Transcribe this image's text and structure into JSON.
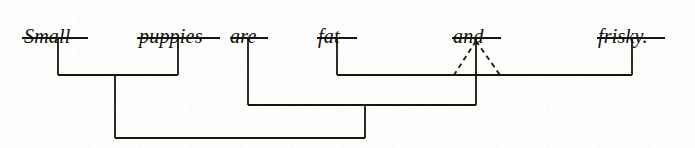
{
  "diagram": {
    "kind": "immediate-constituent-analysis",
    "sentence": "Small puppies are fat and frisky.",
    "canvas": {
      "width": 695,
      "height": 148
    },
    "style": {
      "line_color": "#16160f",
      "background_color": "#fdfdfb",
      "text_color": "#0d0d0d",
      "stroke_width": 1.8,
      "dashed_stroke_width": 1.8,
      "dash_pattern": "5,4"
    },
    "words": [
      {
        "id": "small",
        "text": "Small",
        "text_x": 24,
        "text_y": 26,
        "bar_x1": 22,
        "bar_x2": 88,
        "bar_y": 38,
        "stem_x": 58,
        "stem_to_y": 75
      },
      {
        "id": "puppies",
        "text": "puppies",
        "text_x": 139,
        "text_y": 26,
        "bar_x1": 137,
        "bar_x2": 220,
        "bar_y": 38,
        "stem_x": 178,
        "stem_to_y": 75
      },
      {
        "id": "are",
        "text": "are",
        "text_x": 230,
        "text_y": 26,
        "bar_x1": 230,
        "bar_x2": 268,
        "bar_y": 38,
        "stem_x": 248,
        "stem_to_y": 105
      },
      {
        "id": "fat",
        "text": "fat",
        "text_x": 318,
        "text_y": 26,
        "bar_x1": 317,
        "bar_x2": 357,
        "bar_y": 38,
        "stem_x": 337,
        "stem_to_y": 75
      },
      {
        "id": "and",
        "text": "and",
        "text_x": 453,
        "text_y": 26,
        "bar_x1": 452,
        "bar_x2": 501,
        "bar_y": 38,
        "stem_x": 476,
        "stem_to_y": 75
      },
      {
        "id": "frisky",
        "text": "frisky.",
        "text_x": 598,
        "text_y": 26,
        "bar_x1": 597,
        "bar_x2": 665,
        "bar_y": 38,
        "stem_x": 632,
        "stem_to_y": 75
      }
    ],
    "brackets": [
      {
        "id": "np-small-puppies",
        "label": "noun-phrase-bracket",
        "y": 75,
        "x1": 58,
        "x2": 178,
        "stem_x": 115,
        "stem_to_y": 138
      },
      {
        "id": "adjp-fat-and-frisky",
        "label": "coordinate-adjective-phrase-bracket",
        "y": 75,
        "x1": 337,
        "x2": 632,
        "stem_x": 476,
        "stem_to_y": 105
      },
      {
        "id": "vp-are-adjp",
        "label": "verb-phrase-bracket",
        "y": 105,
        "x1": 248,
        "x2": 476,
        "stem_x": 365,
        "stem_to_y": 138
      },
      {
        "id": "s-np-vp",
        "label": "sentence-bracket",
        "y": 138,
        "x1": 115,
        "x2": 365,
        "stem_x": null,
        "stem_to_y": null
      }
    ],
    "dashed_triangle": {
      "id": "coordinator-triangle",
      "label": "dashed-conjunction-triangle",
      "apex_x": 476,
      "apex_y": 41,
      "left_x": 454,
      "right_x": 500,
      "base_y": 75
    }
  }
}
